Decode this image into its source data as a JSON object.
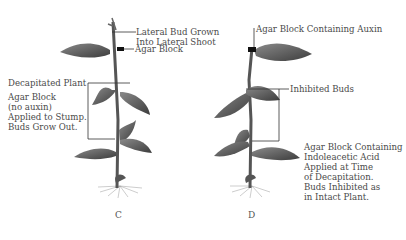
{
  "figure": {
    "panels": [
      {
        "id": "C",
        "letter": "C",
        "labels": {
          "lateral_bud_line1": "Lateral Bud Grown",
          "lateral_bud_line2": "Into Lateral Shoot",
          "agar_block": "Agar Block",
          "decapitated": "Decapitated Plant",
          "desc_line1": "Agar Block",
          "desc_line2": "(no auxin)",
          "desc_line3": "Applied to Stump.",
          "desc_line4": "Buds Grow Out."
        }
      },
      {
        "id": "D",
        "letter": "D",
        "labels": {
          "agar_auxin": "Agar Block Containing Auxin",
          "inhibited": "Inhibited Buds",
          "desc_line1": "Agar Block Containing",
          "desc_line2": "Indoleacetic Acid",
          "desc_line3": "Applied at Time",
          "desc_line4": "of Decapitation.",
          "desc_line5": "Buds Inhibited as",
          "desc_line6": "in Intact Plant."
        }
      }
    ],
    "colors": {
      "leaf": "#6e6e6e",
      "leaf_dark": "#3f3f3f",
      "stem": "#5a5a5a",
      "line": "#333333",
      "text": "#4a4a4a"
    }
  }
}
